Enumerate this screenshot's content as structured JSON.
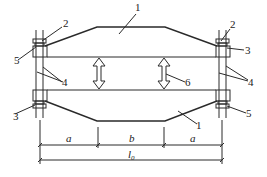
{
  "diagram": {
    "type": "beam-loading-test-setup",
    "labels": {
      "part1_top": "1",
      "part1_bottom": "1",
      "part2_left": "2",
      "part2_right": "2",
      "part3_left": "3",
      "part3_right": "3",
      "part4_left": "4",
      "part4_right": "4",
      "part5_left": "5",
      "part5_right": "5",
      "part6": "6"
    },
    "dimensions": {
      "a_left": "a",
      "b": "b",
      "a_right": "a",
      "span_main": "l",
      "span_sub": "0"
    },
    "colors": {
      "line": "#2a2a2a",
      "background": "#ffffff"
    }
  }
}
